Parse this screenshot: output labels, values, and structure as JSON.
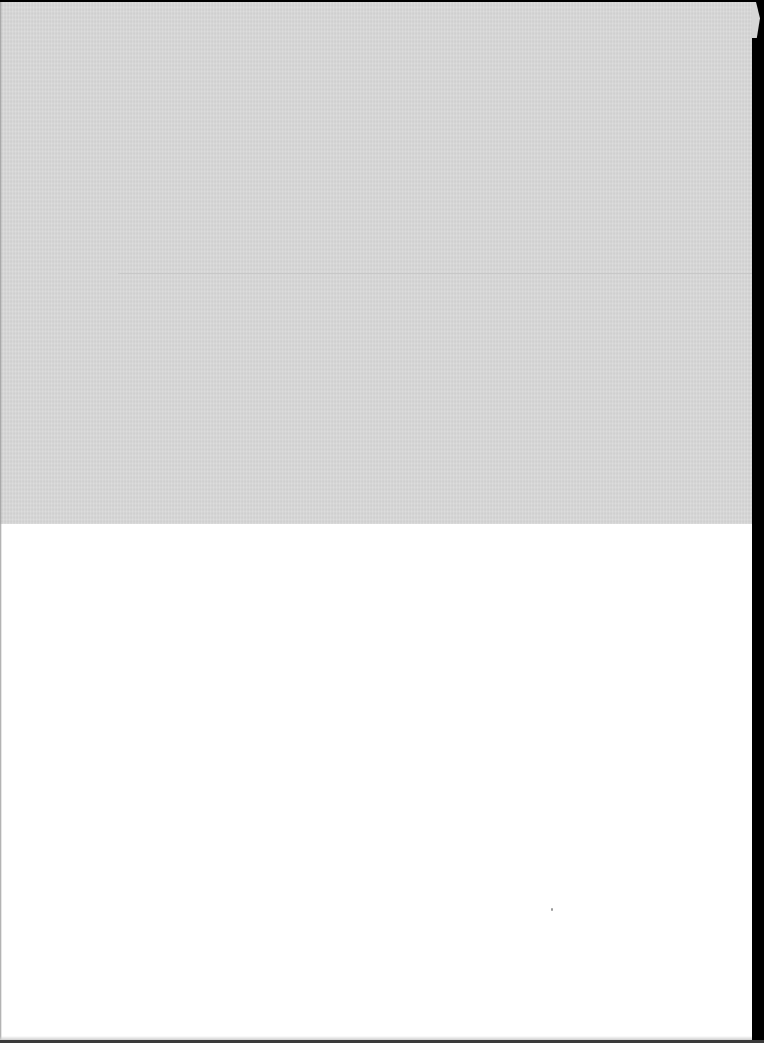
{
  "document": {
    "type": "scanned-blank-page",
    "regions": [
      {
        "name": "shaded-upper-band",
        "color": "#d6d6d6"
      },
      {
        "name": "white-lower-area",
        "color": "#ffffff"
      }
    ],
    "scan_border_color": "#000000",
    "text": ""
  }
}
